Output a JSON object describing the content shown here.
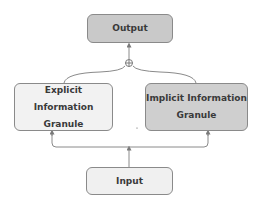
{
  "diagram": {
    "nodes": {
      "output": {
        "label": "Output",
        "fill": "#c9c9c9"
      },
      "explicit": {
        "line1": "Explicit Information",
        "line2": "Granule",
        "fill": "#f2f2f2"
      },
      "implicit": {
        "line1": "Implicit Information",
        "line2": "Granule",
        "fill": "#cfcfcf"
      },
      "input": {
        "label": "Input",
        "fill": "#f0f0f0"
      }
    },
    "junction": {
      "symbol": "circle-plus",
      "meaning": "combine"
    },
    "edges": [
      {
        "from": "input",
        "to": "explicit"
      },
      {
        "from": "input",
        "to": "implicit"
      },
      {
        "from": "explicit",
        "to": "junction"
      },
      {
        "from": "implicit",
        "to": "junction"
      },
      {
        "from": "junction",
        "to": "output"
      }
    ],
    "colors": {
      "stroke": "#8a8a8a",
      "text": "#3a3a3a"
    }
  }
}
